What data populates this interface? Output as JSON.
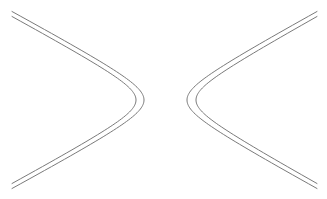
{
  "diagram": {
    "stroke_color": "#7a7a7a",
    "background": "#ffffff",
    "center_y": 100,
    "branches": [
      {
        "name": "left-branch",
        "opens": "left",
        "curves": [
          {
            "name": "left-branch-outer",
            "vertex_x": 144,
            "end_x": 12,
            "half_height": 88.5,
            "shape": 0.55
          },
          {
            "name": "left-branch-inner",
            "vertex_x": 136,
            "end_x": 12,
            "half_height": 83.5,
            "shape": 0.55
          }
        ]
      },
      {
        "name": "right-branch",
        "opens": "right",
        "curves": [
          {
            "name": "right-branch-outer",
            "vertex_x": 187,
            "end_x": 317,
            "half_height": 88.5,
            "shape": 0.55
          },
          {
            "name": "right-branch-inner",
            "vertex_x": 196,
            "end_x": 317,
            "half_height": 83.5,
            "shape": 0.55
          }
        ]
      }
    ]
  }
}
